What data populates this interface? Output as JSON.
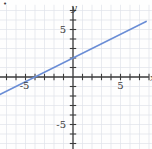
{
  "figure": {
    "name": "linear-function-graph",
    "background_color": "#fefefe",
    "bullet_marker": "•"
  },
  "chart_data": {
    "type": "line",
    "title": "",
    "xlabel": "x",
    "ylabel": "y",
    "xlim": [
      -7.7,
      8.3
    ],
    "ylim": [
      -7.6,
      7.6
    ],
    "xticks": [
      -7,
      -6,
      -5,
      -4,
      -3,
      -2,
      -1,
      1,
      2,
      3,
      4,
      5,
      6,
      7,
      8
    ],
    "yticks": [
      -7,
      -6,
      -5,
      -4,
      -3,
      -2,
      -1,
      1,
      2,
      3,
      4,
      5,
      6,
      7
    ],
    "xtick_labels": [
      {
        "value": -5,
        "text": "-5"
      },
      {
        "value": 5,
        "text": "5"
      }
    ],
    "ytick_labels": [
      {
        "value": 5,
        "text": "5"
      },
      {
        "value": -5,
        "text": "-5"
      }
    ],
    "grid": true,
    "grid_color": "#dfe3ea",
    "axis_color": "#3c3c3c",
    "series": [
      {
        "name": "y = x/2 + 2",
        "equation": "y = 0.5x + 2",
        "slope": 0.5,
        "intercept": 2,
        "color": "#6b8ed6",
        "x_intercept": -4,
        "y_intercept": 2,
        "points": [
          {
            "x": -7.7,
            "y": -1.85
          },
          {
            "x": -4,
            "y": 0
          },
          {
            "x": 0,
            "y": 2
          },
          {
            "x": 7.7,
            "y": 5.85
          }
        ]
      }
    ]
  }
}
